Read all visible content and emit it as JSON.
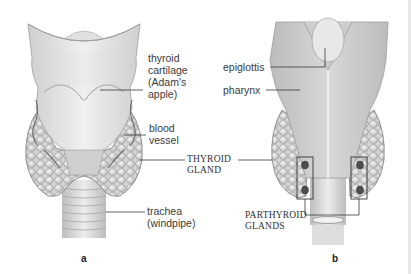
{
  "figure": {
    "panels": [
      {
        "id": "a",
        "label": "a",
        "view": "anterior",
        "annotations": {
          "thyroid_cartilage": "thyroid\ncartilage\n(Adam's\napple)",
          "blood_vessel": "blood\nvessel",
          "trachea": "trachea\n(windpipe)"
        }
      },
      {
        "id": "b",
        "label": "b",
        "view": "posterior",
        "annotations": {
          "epiglottis": "epiglottis",
          "pharynx": "pharynx"
        }
      }
    ],
    "shared_annotations": {
      "thyroid_gland": "THYROID\nGLAND",
      "parathyroid_glands": "PARTHYROID\nGLANDS"
    },
    "colors": {
      "tissue_light": "#e6e6e6",
      "tissue_mid": "#c9c9c9",
      "tissue_dark": "#8a8a8a",
      "leader_line": "#3a3a3a",
      "parathyroid": "#4a4a4a"
    }
  }
}
